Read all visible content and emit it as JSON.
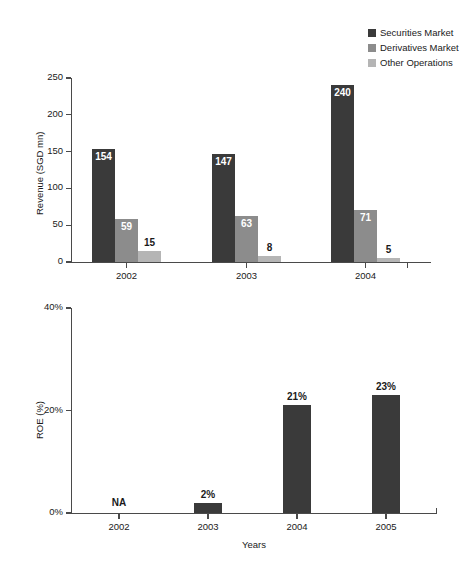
{
  "legend": {
    "items": [
      {
        "label": "Securities Market",
        "color": "#3a3a3a"
      },
      {
        "label": "Derivatives Market",
        "color": "#8c8c8c"
      },
      {
        "label": "Other Operations",
        "color": "#b5b5b5"
      }
    ]
  },
  "chart_data": [
    {
      "type": "bar",
      "title": "",
      "xlabel": "",
      "ylabel": "Revenue (SGD mn)",
      "categories": [
        "2002",
        "2003",
        "2004"
      ],
      "ylim": [
        0,
        250
      ],
      "yticks": [
        "0",
        "50",
        "100",
        "150",
        "200",
        "250"
      ],
      "grid": false,
      "legend_position": "top-right",
      "series": [
        {
          "name": "Securities Market",
          "color": "#3a3a3a",
          "values": [
            154,
            147,
            240
          ],
          "labels": [
            "154",
            "147",
            "240"
          ]
        },
        {
          "name": "Derivatives Market",
          "color": "#8c8c8c",
          "values": [
            59,
            63,
            71
          ],
          "labels": [
            "59",
            "63",
            "71"
          ]
        },
        {
          "name": "Other Operations",
          "color": "#b5b5b5",
          "values": [
            15,
            8,
            5
          ],
          "labels": [
            "15",
            "8",
            "5"
          ]
        }
      ]
    },
    {
      "type": "bar",
      "title": "",
      "xlabel": "Years",
      "ylabel": "ROE (%)",
      "categories": [
        "2002",
        "2003",
        "2004",
        "2005"
      ],
      "ylim": [
        0,
        40
      ],
      "yticks": [
        "0%",
        "20%",
        "40%"
      ],
      "grid": false,
      "series": [
        {
          "name": "ROE",
          "color": "#3a3a3a",
          "values": [
            null,
            2,
            21,
            23
          ],
          "labels": [
            "NA",
            "2%",
            "21%",
            "23%"
          ]
        }
      ]
    }
  ]
}
